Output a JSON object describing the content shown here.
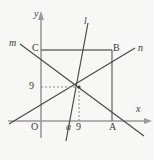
{
  "figure": {
    "colors": {
      "axis": "#9a9a9a",
      "line": "#4a4a4a",
      "rect": "#6e6e6e",
      "dashed": "#8a8a8a",
      "background": "#f7f7f5",
      "text": "#3a3a3a"
    },
    "axes": {
      "x_label": "x",
      "y_label": "y",
      "origin_label": "O"
    },
    "lines": [
      {
        "name": "l",
        "label": "l",
        "description": "steep line through intersection point crossing x-axis at a"
      },
      {
        "name": "m",
        "label": "m",
        "description": "line from upper-left descending to lower-right past A"
      },
      {
        "name": "n",
        "label": "n",
        "description": "line from lower-left ascending to upper-right past B"
      }
    ],
    "points": [
      {
        "name": "A",
        "label": "A",
        "description": "rectangle bottom-right vertex on x-axis"
      },
      {
        "name": "B",
        "label": "B",
        "description": "rectangle top-right vertex"
      },
      {
        "name": "C",
        "label": "C",
        "description": "rectangle top-left vertex on y-axis"
      }
    ],
    "value_labels": {
      "y_value": "9",
      "x_value": "9",
      "x_param": "a"
    }
  }
}
